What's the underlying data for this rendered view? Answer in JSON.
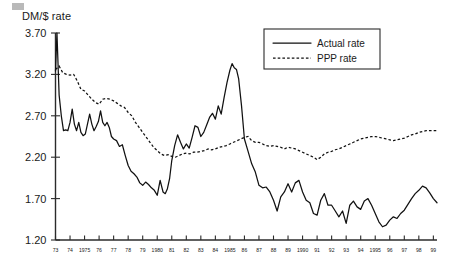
{
  "figure": {
    "background_color": "#ffffff",
    "ink_color": "#111111",
    "corner_mark_color": "#b9b9b9"
  },
  "chart_data": {
    "type": "line",
    "title": "",
    "subtitle": "",
    "xlabel": "",
    "ylabel": "DM/$ rate",
    "ylim": [
      1.2,
      3.7
    ],
    "xlim": [
      1973.0,
      1999.25
    ],
    "grid": false,
    "legend_position": "top-right",
    "ytick_labels": [
      "3.70",
      "3.20",
      "2.70",
      "2.20",
      "1.70",
      "1.20"
    ],
    "ytick_values": [
      3.7,
      3.2,
      2.7,
      2.2,
      1.7,
      1.2
    ],
    "xtick_labels": [
      "73",
      "74",
      "1975",
      "76",
      "77",
      "78",
      "79",
      "1980",
      "81",
      "82",
      "83",
      "84",
      "1985",
      "86",
      "87",
      "88",
      "89",
      "1990",
      "91",
      "92",
      "93",
      "94",
      "1995",
      "96",
      "97",
      "98",
      "99"
    ],
    "xtick_values": [
      1973,
      1974,
      1975,
      1976,
      1977,
      1978,
      1979,
      1980,
      1981,
      1982,
      1983,
      1984,
      1985,
      1986,
      1987,
      1988,
      1989,
      1990,
      1991,
      1992,
      1993,
      1994,
      1995,
      1996,
      1997,
      1998,
      1999
    ],
    "legend": [
      {
        "name": "Actual rate",
        "style": "solid"
      },
      {
        "name": "PPP rate",
        "style": "dashed"
      }
    ],
    "series": [
      {
        "name": "Actual rate",
        "style": "solid",
        "x": [
          1973.0,
          1973.1,
          1973.25,
          1973.4,
          1973.55,
          1973.7,
          1973.85,
          1974.0,
          1974.15,
          1974.3,
          1974.45,
          1974.6,
          1974.75,
          1974.9,
          1975.05,
          1975.2,
          1975.35,
          1975.5,
          1975.65,
          1975.8,
          1975.95,
          1976.1,
          1976.25,
          1976.4,
          1976.55,
          1976.7,
          1976.85,
          1977.0,
          1977.2,
          1977.4,
          1977.6,
          1977.8,
          1978.0,
          1978.2,
          1978.4,
          1978.6,
          1978.8,
          1979.0,
          1979.2,
          1979.4,
          1979.6,
          1979.8,
          1980.0,
          1980.2,
          1980.4,
          1980.55,
          1980.7,
          1980.85,
          1981.0,
          1981.2,
          1981.4,
          1981.6,
          1981.8,
          1982.0,
          1982.2,
          1982.4,
          1982.6,
          1982.8,
          1983.0,
          1983.2,
          1983.4,
          1983.6,
          1983.8,
          1984.0,
          1984.2,
          1984.4,
          1984.6,
          1984.8,
          1985.0,
          1985.15,
          1985.3,
          1985.45,
          1985.6,
          1985.8,
          1986.0,
          1986.25,
          1986.5,
          1986.75,
          1987.0,
          1987.25,
          1987.5,
          1987.75,
          1988.0,
          1988.25,
          1988.5,
          1988.75,
          1989.0,
          1989.25,
          1989.5,
          1989.75,
          1990.0,
          1990.25,
          1990.5,
          1990.75,
          1991.0,
          1991.25,
          1991.5,
          1991.75,
          1992.0,
          1992.25,
          1992.5,
          1992.75,
          1993.0,
          1993.25,
          1993.5,
          1993.75,
          1994.0,
          1994.25,
          1994.5,
          1994.75,
          1995.0,
          1995.25,
          1995.5,
          1995.75,
          1996.0,
          1996.25,
          1996.5,
          1996.75,
          1997.0,
          1997.25,
          1997.5,
          1997.75,
          1998.0,
          1998.25,
          1998.5,
          1998.75,
          1999.0,
          1999.25
        ],
        "y": [
          3.24,
          3.7,
          2.95,
          2.7,
          2.52,
          2.53,
          2.52,
          2.62,
          2.78,
          2.6,
          2.52,
          2.62,
          2.5,
          2.46,
          2.48,
          2.6,
          2.72,
          2.6,
          2.52,
          2.57,
          2.63,
          2.76,
          2.62,
          2.58,
          2.62,
          2.56,
          2.45,
          2.42,
          2.4,
          2.33,
          2.35,
          2.22,
          2.1,
          2.03,
          2.0,
          1.96,
          1.89,
          1.86,
          1.9,
          1.87,
          1.83,
          1.8,
          1.74,
          1.92,
          1.78,
          1.76,
          1.82,
          1.94,
          2.16,
          2.34,
          2.47,
          2.38,
          2.3,
          2.36,
          2.31,
          2.44,
          2.58,
          2.56,
          2.45,
          2.5,
          2.59,
          2.68,
          2.73,
          2.66,
          2.82,
          2.72,
          2.92,
          3.1,
          3.25,
          3.33,
          3.28,
          3.26,
          3.15,
          2.82,
          2.42,
          2.27,
          2.12,
          2.02,
          1.86,
          1.83,
          1.84,
          1.78,
          1.68,
          1.55,
          1.72,
          1.78,
          1.88,
          1.78,
          1.89,
          1.92,
          1.78,
          1.68,
          1.65,
          1.52,
          1.5,
          1.68,
          1.76,
          1.62,
          1.62,
          1.55,
          1.48,
          1.55,
          1.4,
          1.62,
          1.67,
          1.6,
          1.57,
          1.67,
          1.7,
          1.62,
          1.52,
          1.42,
          1.36,
          1.38,
          1.44,
          1.48,
          1.46,
          1.52,
          1.56,
          1.63,
          1.7,
          1.76,
          1.8,
          1.85,
          1.83,
          1.77,
          1.7,
          1.65
        ]
      },
      {
        "name": "PPP rate",
        "style": "dashed",
        "x": [
          1973.0,
          1973.25,
          1973.5,
          1973.75,
          1974.0,
          1974.25,
          1974.5,
          1974.75,
          1975.0,
          1975.25,
          1975.5,
          1975.75,
          1976.0,
          1976.25,
          1976.5,
          1976.75,
          1977.0,
          1977.25,
          1977.5,
          1977.75,
          1978.0,
          1978.25,
          1978.5,
          1978.75,
          1979.0,
          1979.25,
          1979.5,
          1979.75,
          1980.0,
          1980.25,
          1980.5,
          1980.75,
          1981.0,
          1981.25,
          1981.5,
          1981.75,
          1982.0,
          1982.25,
          1982.5,
          1982.75,
          1983.0,
          1983.25,
          1983.5,
          1983.75,
          1984.0,
          1984.25,
          1984.5,
          1984.75,
          1985.0,
          1985.25,
          1985.5,
          1985.75,
          1986.0,
          1986.25,
          1986.5,
          1986.75,
          1987.0,
          1987.25,
          1987.5,
          1987.75,
          1988.0,
          1988.25,
          1988.5,
          1988.75,
          1989.0,
          1989.25,
          1989.5,
          1989.75,
          1990.0,
          1990.25,
          1990.5,
          1990.75,
          1991.0,
          1991.25,
          1991.5,
          1991.75,
          1992.0,
          1992.25,
          1992.5,
          1992.75,
          1993.0,
          1993.25,
          1993.5,
          1993.75,
          1994.0,
          1994.25,
          1994.5,
          1994.75,
          1995.0,
          1995.25,
          1995.5,
          1995.75,
          1996.0,
          1996.25,
          1996.5,
          1996.75,
          1997.0,
          1997.25,
          1997.5,
          1997.75,
          1998.0,
          1998.25,
          1998.5,
          1998.75,
          1999.0,
          1999.25
        ],
        "y": [
          3.26,
          3.3,
          3.22,
          3.2,
          3.19,
          3.2,
          3.12,
          3.02,
          3.0,
          2.95,
          2.9,
          2.86,
          2.84,
          2.9,
          2.91,
          2.9,
          2.88,
          2.85,
          2.82,
          2.8,
          2.74,
          2.7,
          2.62,
          2.56,
          2.5,
          2.44,
          2.38,
          2.32,
          2.28,
          2.24,
          2.22,
          2.23,
          2.21,
          2.2,
          2.22,
          2.24,
          2.25,
          2.24,
          2.26,
          2.26,
          2.27,
          2.28,
          2.3,
          2.29,
          2.3,
          2.32,
          2.33,
          2.34,
          2.36,
          2.38,
          2.4,
          2.42,
          2.44,
          2.45,
          2.4,
          2.38,
          2.38,
          2.36,
          2.34,
          2.33,
          2.34,
          2.33,
          2.32,
          2.3,
          2.32,
          2.31,
          2.3,
          2.28,
          2.26,
          2.24,
          2.22,
          2.2,
          2.17,
          2.2,
          2.24,
          2.26,
          2.27,
          2.29,
          2.3,
          2.32,
          2.34,
          2.36,
          2.38,
          2.4,
          2.42,
          2.43,
          2.44,
          2.45,
          2.45,
          2.44,
          2.43,
          2.42,
          2.41,
          2.4,
          2.41,
          2.42,
          2.43,
          2.45,
          2.47,
          2.48,
          2.5,
          2.51,
          2.52,
          2.52,
          2.52,
          2.52
        ]
      }
    ]
  }
}
